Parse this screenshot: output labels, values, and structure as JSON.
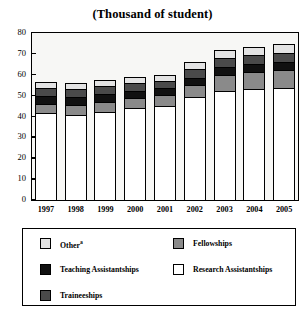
{
  "chart": {
    "title": "(Thousand of student)"
  },
  "axes": {
    "y_ticks": [
      "80",
      "70",
      "60",
      "50",
      "40",
      "30",
      "20",
      "10",
      "0"
    ],
    "x_ticks": [
      "1997",
      "1998",
      "1999",
      "2000",
      "2001",
      "2002",
      "2003",
      "2004",
      "2005"
    ]
  },
  "legend": {
    "items": [
      {
        "label": "Other",
        "sup": "a",
        "color": "#e3e3e3",
        "name": "other"
      },
      {
        "label": "Fellowships",
        "sup": "",
        "color": "#8a8a8a",
        "name": "fellowships"
      },
      {
        "label": "Teaching Assistantships",
        "sup": "",
        "color": "#111111",
        "name": "teaching-assistantships"
      },
      {
        "label": "Research Assistantships",
        "sup": "",
        "color": "#ffffff",
        "name": "research-assistantships"
      },
      {
        "label": "Traineeships",
        "sup": "",
        "color": "#4a4a4a",
        "name": "traineeships"
      }
    ]
  },
  "chart_data": {
    "type": "bar",
    "subtype": "stacked",
    "title": "(Thousand of student)",
    "xlabel": "",
    "ylabel": "",
    "ylim": [
      0,
      80
    ],
    "ytick_step": 10,
    "grid": false,
    "legend_position": "bottom",
    "categories": [
      "1997",
      "1998",
      "1999",
      "2000",
      "2001",
      "2002",
      "2003",
      "2004",
      "2005"
    ],
    "series": [
      {
        "name": "Research Assistantships",
        "color": "#ffffff",
        "values": [
          42.0,
          41.0,
          42.5,
          44.5,
          45.5,
          49.5,
          52.5,
          53.5,
          54.0
        ]
      },
      {
        "name": "Fellowships",
        "color": "#8a8a8a",
        "values": [
          4.5,
          5.0,
          5.0,
          4.5,
          5.0,
          6.0,
          7.5,
          8.0,
          8.5
        ]
      },
      {
        "name": "Teaching Assistantships",
        "color": "#111111",
        "values": [
          3.5,
          3.5,
          3.5,
          3.5,
          3.5,
          3.5,
          4.0,
          4.0,
          4.0
        ]
      },
      {
        "name": "Traineeships",
        "color": "#4a4a4a",
        "values": [
          4.0,
          4.0,
          4.0,
          4.0,
          3.5,
          4.0,
          4.5,
          4.5,
          4.5
        ]
      },
      {
        "name": "Other",
        "color": "#e3e3e3",
        "values": [
          3.0,
          3.0,
          3.0,
          3.0,
          3.0,
          3.5,
          4.0,
          4.0,
          4.0
        ]
      }
    ],
    "totals": [
      57.0,
      56.5,
      58.0,
      59.5,
      60.5,
      66.5,
      72.5,
      74.0,
      75.0
    ]
  }
}
